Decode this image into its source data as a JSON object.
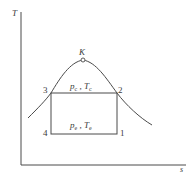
{
  "diagram": {
    "type": "T-s diagram (refrigeration cycle)",
    "axes": {
      "y_label": "T",
      "x_label": "s"
    },
    "critical_point": {
      "label": "K"
    },
    "states": [
      {
        "id": "1",
        "label": "1"
      },
      {
        "id": "2",
        "label": "2"
      },
      {
        "id": "3",
        "label": "3"
      },
      {
        "id": "4",
        "label": "4"
      }
    ],
    "top_line": {
      "p_symbol": "p",
      "p_sub": "c",
      "sep": " , ",
      "t_symbol": "T",
      "t_sub": "c"
    },
    "bottom_line": {
      "p_symbol": "p",
      "p_sub": "e",
      "sep": " , ",
      "t_symbol": "T",
      "t_sub": "e"
    },
    "colors": {
      "line": "#4a4a4a",
      "text": "#3a3a3a",
      "background": "#ffffff"
    }
  }
}
